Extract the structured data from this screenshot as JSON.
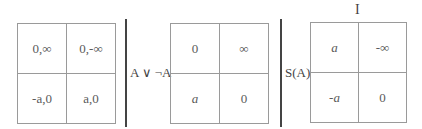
{
  "top_label": "I",
  "matrices": [
    {
      "row_label": "",
      "cells": [
        [
          "0,∞",
          "0,-∞"
        ],
        [
          "-a,0",
          "a,0"
        ]
      ]
    },
    {
      "row_label": "A ∨ ¬A",
      "cells": [
        [
          "0",
          "∞"
        ],
        [
          "a",
          "0"
        ]
      ]
    },
    {
      "row_label": "S(A)",
      "cells": [
        [
          "a",
          "-∞"
        ],
        [
          "-a",
          "0"
        ]
      ]
    }
  ]
}
